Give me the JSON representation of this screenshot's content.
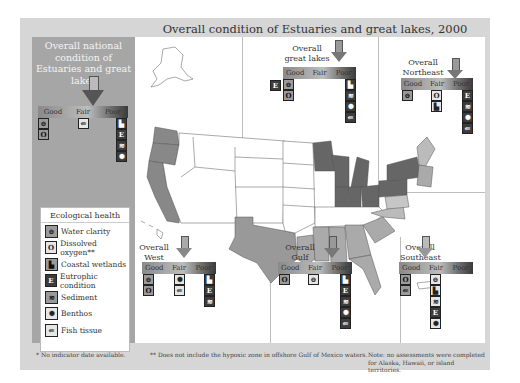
{
  "title": "Overall condition of Estuaries and great lakes, 2000",
  "scale_labels": [
    "Good",
    "Fair",
    "Poor"
  ],
  "national": {
    "label": "Overall national condition of Estuaries and great lakes",
    "rating": "Fair",
    "good": [
      "water-clarity",
      "dissolved-oxygen"
    ],
    "fair": [
      "fish-tissue"
    ],
    "poor": [
      "coastal-wetlands",
      "eutrophic-condition",
      "sediment",
      "benthos"
    ]
  },
  "regions": [
    {
      "id": "great-lakes",
      "label": "Overall great lakes",
      "rating": "Poor",
      "no_data": [
        "eutrophic-condition"
      ],
      "good": [
        "water-clarity",
        "dissolved-oxygen"
      ],
      "fair": [],
      "poor": [
        "coastal-wetlands",
        "sediment",
        "benthos",
        "fish-tissue"
      ]
    },
    {
      "id": "northeast",
      "label": "Overall Northeast",
      "rating": "Poor",
      "good": [
        "water-clarity"
      ],
      "fair": [
        "dissolved-oxygen",
        "coastal-wetlands"
      ],
      "poor": [
        "eutrophic-condition",
        "sediment",
        "benthos",
        "fish-tissue"
      ]
    },
    {
      "id": "west",
      "label": "Overall West",
      "rating": "Fair",
      "good": [
        "water-clarity",
        "dissolved-oxygen"
      ],
      "fair": [
        "benthos",
        "fish-tissue"
      ],
      "poor": [
        "coastal-wetlands",
        "eutrophic-condition",
        "sediment"
      ]
    },
    {
      "id": "gulf",
      "label": "Overall Gulf",
      "rating": "Poor",
      "good": [
        "dissolved-oxygen"
      ],
      "fair": [
        "water-clarity"
      ],
      "poor": [
        "coastal-wetlands",
        "eutrophic-condition",
        "sediment",
        "benthos",
        "fish-tissue"
      ]
    },
    {
      "id": "southeast",
      "label": "Overall Southeast",
      "rating": "Fair",
      "good": [
        "dissolved-oxygen",
        "fish-tissue"
      ],
      "fair": [
        "water-clarity",
        "coastal-wetlands",
        "sediment",
        "eutrophic-condition",
        "benthos"
      ],
      "poor": []
    }
  ],
  "legend": {
    "title": "Ecological health",
    "items": [
      {
        "icon": "water-clarity-icon",
        "glyph": "⊖",
        "label": "Water clarity"
      },
      {
        "icon": "dissolved-oxygen-icon",
        "glyph": "O",
        "label": "Dissolved oxygen**"
      },
      {
        "icon": "coastal-wetlands-icon",
        "glyph": "▙",
        "label": "Coastal wetlands"
      },
      {
        "icon": "eutrophic-condition-icon",
        "glyph": "E",
        "label": "Eutrophic condition"
      },
      {
        "icon": "sediment-icon",
        "glyph": "≋",
        "label": "Sediment"
      },
      {
        "icon": "benthos-icon",
        "glyph": "✺",
        "label": "Benthos"
      },
      {
        "icon": "fish-tissue-icon",
        "glyph": "⇚",
        "label": "Fish tissue"
      }
    ]
  },
  "footnotes": {
    "no_data": "* No indicator date available.",
    "hypoxic": "** Does not include the hypoxic zone in offshore Gulf of Mexico waters.",
    "note": "Note: no assessments were completed for Alaska, Hawaii, or island territories."
  },
  "colors": {
    "good": "#8a8a8a",
    "fair": "#c8c8c8",
    "poor": "#3a3a3a",
    "region_good": "#a0a0a0",
    "region_poor": "#6e6e6e",
    "region_fair": "#b8b8b8"
  }
}
